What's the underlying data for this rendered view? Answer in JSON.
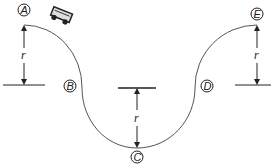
{
  "diagram": {
    "points": [
      {
        "id": "A",
        "label": "A",
        "x": 24,
        "y": 10
      },
      {
        "id": "B",
        "label": "B",
        "x": 70,
        "y": 86
      },
      {
        "id": "C",
        "label": "C",
        "x": 137,
        "y": 157
      },
      {
        "id": "D",
        "label": "D",
        "x": 207,
        "y": 86
      },
      {
        "id": "E",
        "label": "E",
        "x": 257,
        "y": 14
      }
    ],
    "radius_labels": [
      {
        "id": "r-left",
        "label": "r"
      },
      {
        "id": "r-center",
        "label": "r"
      },
      {
        "id": "r-right",
        "label": "r"
      }
    ],
    "colors": {
      "track": "#555555",
      "ink": "#222222",
      "car_body": "#dddddd"
    }
  }
}
